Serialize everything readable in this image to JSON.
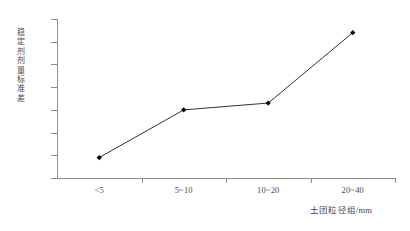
{
  "chart_data": {
    "type": "line",
    "title": "",
    "xlabel": "土团粒径组/mm",
    "ylabel": "稳定剂剂量标准差",
    "categories": [
      "<5",
      "5~10",
      "10~20",
      "20~40"
    ],
    "values": [
      0.09,
      0.3,
      0.33,
      0.64
    ],
    "series": [
      {
        "name": "稳定剂剂量标准差",
        "values": [
          0.09,
          0.3,
          0.33,
          0.64
        ]
      }
    ],
    "ylim": [
      0,
      0.7
    ],
    "y_ticks": [
      "0",
      "0.1",
      "0.2",
      "0.3",
      "0.4",
      "0.5",
      "0.6",
      "0.7"
    ],
    "y_tick_values": [
      0,
      0.1,
      0.2,
      0.3,
      0.4,
      0.5,
      0.6,
      0.7
    ],
    "grid": false,
    "legend": false,
    "legend_position": "none",
    "marker": "filled-diamond",
    "line_color": "#1a1a1a",
    "marker_color": "#000000",
    "axis_color": "#8d8d8d",
    "background_color": "#ffffff"
  },
  "axes": {
    "y_title": "稳定剂剂量标准差",
    "x_title": "土团粒径组/mm"
  }
}
